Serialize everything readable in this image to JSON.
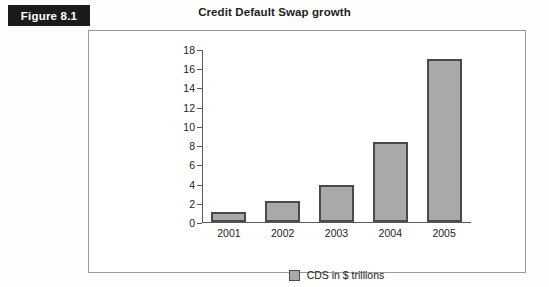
{
  "figure": {
    "tag_label": "Figure 8.1"
  },
  "chart_data": {
    "type": "bar",
    "title": "Credit Default Swap growth",
    "xlabel": "",
    "ylabel": "",
    "categories": [
      "2001",
      "2002",
      "2003",
      "2004",
      "2005"
    ],
    "values": [
      1.0,
      2.2,
      3.8,
      8.3,
      17.0
    ],
    "series": [
      {
        "name": "CDS in $ trillions",
        "values": [
          1.0,
          2.2,
          3.8,
          8.3,
          17.0
        ]
      }
    ],
    "ylim": [
      0,
      18
    ],
    "ytick_step": 2,
    "yticks": [
      "0",
      "2",
      "4",
      "6",
      "8",
      "10",
      "12",
      "14",
      "16",
      "18"
    ],
    "grid": false,
    "legend": {
      "position": "bottom",
      "entries": [
        "CDS in $ trillions"
      ]
    },
    "colors": {
      "bar_fill": "#a9a9a9",
      "bar_border": "#4a4a4a",
      "axis": "#5a5a5a",
      "frame": "#9a9a9a",
      "text": "#232323",
      "tag_background": "#1b1b1b",
      "tag_text": "#ffffff"
    }
  }
}
